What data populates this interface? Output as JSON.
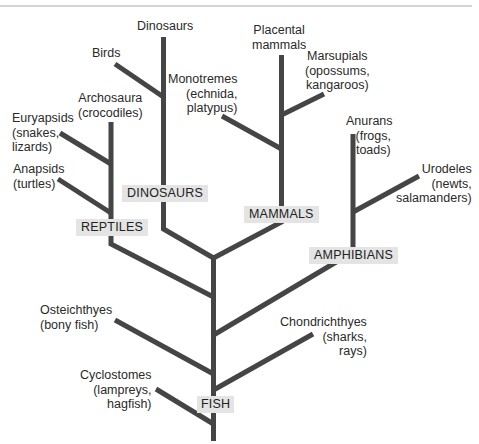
{
  "diagram": {
    "type": "phylogenetic-tree",
    "line_color": "#444444",
    "group_label_bg": "#e4e4e4",
    "groups": {
      "reptiles": "REPTILES",
      "dinosaurs": "DINOSAURS",
      "mammals": "MAMMALS",
      "amphibians": "AMPHIBIANS",
      "fish": "FISH"
    },
    "taxa": {
      "dinosaurs": "Dinosaurs",
      "birds": "Birds",
      "archosaura_1": "Archosaura",
      "archosaura_2": "(crocodiles)",
      "euryapsids_1": "Euryapsids",
      "euryapsids_2": "(snakes,",
      "euryapsids_3": "lizards)",
      "anapsids_1": "Anapsids",
      "anapsids_2": "(turtles)",
      "placental_1": "Placental",
      "placental_2": "mammals",
      "marsupials_1": "Marsupials",
      "marsupials_2": "(opossums,",
      "marsupials_3": "kangaroos)",
      "monotremes_1": "Monotremes",
      "monotremes_2": "(echnida,",
      "monotremes_3": "platypus)",
      "anurans_1": "Anurans",
      "anurans_2": "(frogs,",
      "anurans_3": "toads)",
      "urodeles_1": "Urodeles",
      "urodeles_2": "(newts,",
      "urodeles_3": "salamanders)",
      "osteichthyes_1": "Osteichthyes",
      "osteichthyes_2": "(bony fish)",
      "chondrichthyes_1": "Chondrichthyes",
      "chondrichthyes_2": "(sharks,",
      "chondrichthyes_3": "rays)",
      "cyclostomes_1": "Cyclostomes",
      "cyclostomes_2": "(lampreys,",
      "cyclostomes_3": "hagfish)"
    }
  }
}
